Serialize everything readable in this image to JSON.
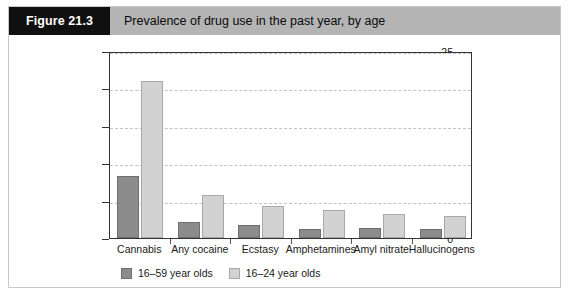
{
  "figure": {
    "number_label": "Figure 21.3",
    "title": "Prevalence of drug use in the past year, by age"
  },
  "colors": {
    "header_band": "#b4b4b4",
    "number_box": "#101010",
    "series_16_59": "#8c8c8c",
    "series_16_24": "#d2d2d2",
    "axis": "#333333",
    "gridline": "#c2c2c2"
  },
  "chart_data": {
    "type": "bar",
    "title": "Prevalence of drug use in the past year, by age",
    "xlabel": "",
    "ylabel": "",
    "ylim": [
      0,
      25
    ],
    "yticks": [
      0,
      5,
      10,
      15,
      20,
      25
    ],
    "ytick_labels": [
      "0",
      "5",
      "10",
      "15",
      "20",
      "25"
    ],
    "grid": true,
    "legend_position": "bottom-left",
    "categories": [
      "Cannabis",
      "Any cocaine",
      "Ecstasy",
      "Amphetamines",
      "Amyl nitrate",
      "Hallucinogens"
    ],
    "series": [
      {
        "name": "16–59 year olds",
        "color": "#8c8c8c",
        "values": [
          8.3,
          2.2,
          1.7,
          1.2,
          1.3,
          1.2
        ]
      },
      {
        "name": "16–24 year olds",
        "color": "#d2d2d2",
        "values": [
          21.0,
          5.7,
          4.3,
          3.7,
          3.2,
          2.9
        ]
      }
    ]
  }
}
